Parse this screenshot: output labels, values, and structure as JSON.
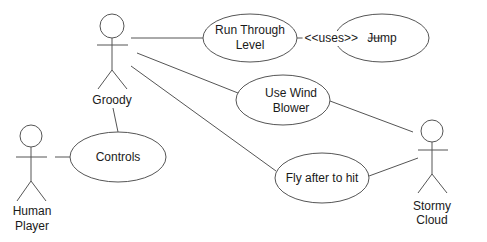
{
  "diagram": {
    "type": "uml-use-case",
    "actors": [
      {
        "id": "groody",
        "label_lines": [
          "Groody"
        ]
      },
      {
        "id": "human-player",
        "label_lines": [
          "Human",
          "Player"
        ]
      },
      {
        "id": "stormy-cloud",
        "label_lines": [
          "Stormy",
          "Cloud"
        ]
      }
    ],
    "use_cases": [
      {
        "id": "run-through-level",
        "label_lines": [
          "Run Through",
          "Level"
        ]
      },
      {
        "id": "jump",
        "label_lines": [
          "Jump"
        ]
      },
      {
        "id": "use-wind-blower",
        "label_lines": [
          "Use Wind",
          "Blower"
        ]
      },
      {
        "id": "controls",
        "label_lines": [
          "Controls"
        ]
      },
      {
        "id": "fly-after-to-hit",
        "label_lines": [
          "Fly after to hit"
        ]
      }
    ],
    "relationships": [
      {
        "from": "groody",
        "to": "run-through-level",
        "type": "association"
      },
      {
        "from": "groody",
        "to": "use-wind-blower",
        "type": "association"
      },
      {
        "from": "groody",
        "to": "fly-after-to-hit",
        "type": "association"
      },
      {
        "from": "groody",
        "to": "controls",
        "type": "association"
      },
      {
        "from": "human-player",
        "to": "controls",
        "type": "association"
      },
      {
        "from": "stormy-cloud",
        "to": "use-wind-blower",
        "type": "association"
      },
      {
        "from": "stormy-cloud",
        "to": "fly-after-to-hit",
        "type": "association"
      },
      {
        "from": "run-through-level",
        "to": "jump",
        "type": "uses",
        "label": "<<uses>>"
      }
    ],
    "colors": {
      "stroke": "#555555",
      "text": "#1a1a1a",
      "background": "#ffffff"
    }
  }
}
